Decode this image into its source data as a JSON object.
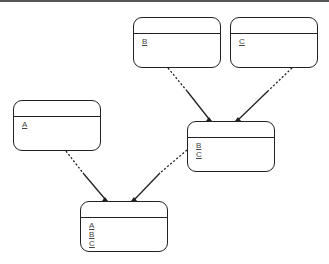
{
  "diagram": {
    "type": "entity-relationship",
    "entities": [
      {
        "id": "B",
        "keys": [
          "B"
        ]
      },
      {
        "id": "C",
        "keys": [
          "C"
        ]
      },
      {
        "id": "A",
        "keys": [
          "A"
        ]
      },
      {
        "id": "BC",
        "keys": [
          "B",
          "C"
        ]
      },
      {
        "id": "ABC",
        "keys": [
          "A",
          "B",
          "C"
        ]
      }
    ],
    "relationships": [
      {
        "from": "B",
        "to": "BC",
        "style": "dashed-then-solid"
      },
      {
        "from": "C",
        "to": "BC",
        "style": "dashed-then-solid"
      },
      {
        "from": "A",
        "to": "ABC",
        "style": "dashed-then-solid"
      },
      {
        "from": "BC",
        "to": "ABC",
        "style": "dashed-then-solid"
      }
    ]
  },
  "colors": {
    "line": "#222222",
    "text": "#444444",
    "background": "#ffffff"
  }
}
